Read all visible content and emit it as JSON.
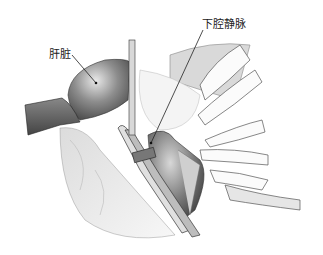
{
  "illustration": {
    "subject": "surgical illustration of inferior vena cava exposure with clamp",
    "labels": [
      {
        "id": "liver",
        "text": "肝脏",
        "x": 49,
        "y": 45,
        "pointer_end": [
          96,
          83
        ]
      },
      {
        "id": "ivc",
        "text": "下腔静脉",
        "x": 202,
        "y": 15,
        "pointer_end": [
          151,
          143
        ]
      }
    ]
  },
  "colors": {
    "background": "#ffffff",
    "line": "#2a2a2a",
    "shade_dark": "#555555",
    "shade_mid": "#8a8a8a",
    "shade_light": "#cfcfcf"
  }
}
